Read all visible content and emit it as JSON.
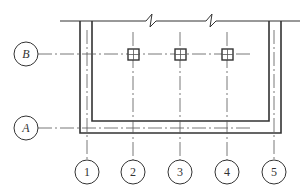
{
  "diagram": {
    "type": "structural-axis-plan",
    "colors": {
      "background": "#ffffff",
      "line": "#333333",
      "axis_line": "#555555"
    },
    "horizontal_axes": [
      {
        "label": "B",
        "y": 54
      },
      {
        "label": "A",
        "y": 128
      }
    ],
    "vertical_axes": [
      {
        "label": "1",
        "x": 87
      },
      {
        "label": "2",
        "x": 133
      },
      {
        "label": "3",
        "x": 180
      },
      {
        "label": "4",
        "x": 227
      },
      {
        "label": "5",
        "x": 274
      }
    ],
    "column_markers": [
      {
        "axis": "2",
        "row": "B"
      },
      {
        "axis": "3",
        "row": "B"
      },
      {
        "axis": "4",
        "row": "B"
      }
    ],
    "break_marks": 2
  }
}
